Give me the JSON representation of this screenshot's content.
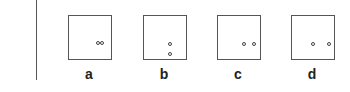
{
  "figure": {
    "line_color": "#555555",
    "panels": [
      {
        "id": "a",
        "label": "a",
        "left": 68,
        "dots": [
          {
            "x": 29,
            "y": 27
          },
          {
            "x": 33,
            "y": 27
          }
        ]
      },
      {
        "id": "b",
        "label": "b",
        "left": 143,
        "dots": [
          {
            "x": 26,
            "y": 28
          },
          {
            "x": 26,
            "y": 38
          }
        ]
      },
      {
        "id": "c",
        "label": "c",
        "left": 217,
        "dots": [
          {
            "x": 26,
            "y": 28
          },
          {
            "x": 36,
            "y": 28
          }
        ]
      },
      {
        "id": "d",
        "label": "d",
        "left": 291,
        "dots": [
          {
            "x": 21,
            "y": 28
          },
          {
            "x": 37,
            "y": 28
          }
        ]
      }
    ]
  }
}
